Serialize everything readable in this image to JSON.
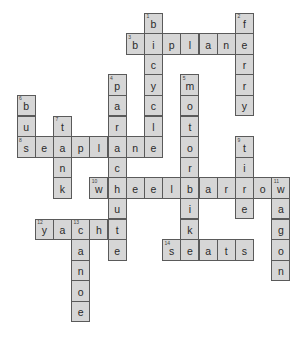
{
  "puzzle": {
    "type": "crossword",
    "grid_origin": {
      "x": 16.5,
      "y": 12.5
    },
    "cell_size": {
      "w": 18.2,
      "h": 20.6
    },
    "colors": {
      "cell_fill": "#d6d6d6",
      "cell_border": "#5a5a5a",
      "letter": "#2a2a2a",
      "background": "#ffffff"
    },
    "words": [
      {
        "number": 1,
        "answer": "bicycle",
        "direction": "down",
        "row": 0,
        "col": 7
      },
      {
        "number": 2,
        "answer": "ferry",
        "direction": "down",
        "row": 0,
        "col": 12
      },
      {
        "number": 3,
        "answer": "biplane",
        "direction": "across",
        "row": 1,
        "col": 6
      },
      {
        "number": 4,
        "answer": "parachute",
        "direction": "down",
        "row": 3,
        "col": 5
      },
      {
        "number": 5,
        "answer": "motorbike",
        "direction": "down",
        "row": 3,
        "col": 9
      },
      {
        "number": 6,
        "answer": "bus",
        "direction": "down",
        "row": 4,
        "col": 0
      },
      {
        "number": 7,
        "answer": "tank",
        "direction": "down",
        "row": 5,
        "col": 2
      },
      {
        "number": 8,
        "answer": "seaplane",
        "direction": "across",
        "row": 6,
        "col": 0
      },
      {
        "number": 9,
        "answer": "tire",
        "direction": "down",
        "row": 6,
        "col": 12
      },
      {
        "number": 10,
        "answer": "wheelbarrow",
        "direction": "across",
        "row": 8,
        "col": 4
      },
      {
        "number": 11,
        "answer": "wagon",
        "direction": "down",
        "row": 8,
        "col": 14
      },
      {
        "number": 12,
        "answer": "yacht",
        "direction": "across",
        "row": 10,
        "col": 1
      },
      {
        "number": 13,
        "answer": "canoe",
        "direction": "down",
        "row": 10,
        "col": 3
      },
      {
        "number": 14,
        "answer": "seats",
        "direction": "across",
        "row": 11,
        "col": 8
      }
    ]
  }
}
